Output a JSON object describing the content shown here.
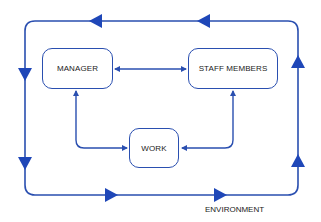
{
  "diagram": {
    "nodes": {
      "manager": {
        "label": "MANAGER"
      },
      "staff": {
        "label": "STAFF MEMBERS"
      },
      "work": {
        "label": "WORK"
      }
    },
    "environment_label": "ENVIRONMENT",
    "edges": [
      {
        "from": "manager",
        "to": "staff",
        "type": "bidirectional"
      },
      {
        "from": "manager",
        "to": "work",
        "type": "bidirectional"
      },
      {
        "from": "staff",
        "to": "work",
        "type": "bidirectional"
      }
    ],
    "outer_loop": {
      "direction": "counter-clockwise",
      "label": "ENVIRONMENT"
    },
    "colors": {
      "line": "#2a4fb0",
      "arrow_fill": "#1f47b8",
      "text": "#1a1a1a",
      "background": "#ffffff"
    }
  }
}
